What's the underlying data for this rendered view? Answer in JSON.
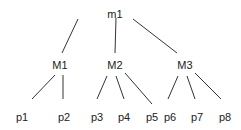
{
  "diagram": {
    "type": "tree",
    "root": {
      "id": "m1",
      "label": "m1",
      "x": 115,
      "y": 14
    },
    "level1": [
      {
        "id": "M1",
        "label": "M1",
        "x": 60,
        "y": 65
      },
      {
        "id": "M2",
        "label": "M2",
        "x": 115,
        "y": 65
      },
      {
        "id": "M3",
        "label": "M3",
        "x": 185,
        "y": 65
      }
    ],
    "leaves": [
      {
        "id": "p1",
        "label": "p1",
        "parent": "M1",
        "x": 22,
        "y": 117
      },
      {
        "id": "p2",
        "label": "p2",
        "parent": "M1",
        "x": 64,
        "y": 117
      },
      {
        "id": "p3",
        "label": "p3",
        "parent": "M2",
        "x": 97,
        "y": 117
      },
      {
        "id": "p4",
        "label": "p4",
        "parent": "M2",
        "x": 124,
        "y": 117
      },
      {
        "id": "p5",
        "label": "p5",
        "parent": "M2",
        "x": 152,
        "y": 117
      },
      {
        "id": "p6",
        "label": "p6",
        "parent": "M3",
        "x": 170,
        "y": 117
      },
      {
        "id": "p7",
        "label": "p7",
        "parent": "M3",
        "x": 197,
        "y": 117
      },
      {
        "id": "p8",
        "label": "p8",
        "parent": "M3",
        "x": 225,
        "y": 117
      }
    ],
    "edges": [
      {
        "from": "m1",
        "to": "M1",
        "x1": 78,
        "y1": 19,
        "x2": 62,
        "y2": 53
      },
      {
        "from": "m1",
        "to": "M2",
        "x1": 116,
        "y1": 18,
        "x2": 115,
        "y2": 53
      },
      {
        "from": "m1",
        "to": "M3",
        "x1": 133,
        "y1": 19,
        "x2": 177,
        "y2": 53
      },
      {
        "from": "M1",
        "to": "p1",
        "x1": 55,
        "y1": 75,
        "x2": 32,
        "y2": 99
      },
      {
        "from": "M1",
        "to": "p2",
        "x1": 63,
        "y1": 75,
        "x2": 63,
        "y2": 99
      },
      {
        "from": "M2",
        "to": "p3",
        "x1": 107,
        "y1": 76,
        "x2": 97,
        "y2": 99
      },
      {
        "from": "M2",
        "to": "p4",
        "x1": 116,
        "y1": 76,
        "x2": 124,
        "y2": 99
      },
      {
        "from": "M2",
        "to": "p5",
        "x1": 125,
        "y1": 73,
        "x2": 152,
        "y2": 104
      },
      {
        "from": "M3",
        "to": "p6",
        "x1": 178,
        "y1": 76,
        "x2": 168,
        "y2": 99
      },
      {
        "from": "M3",
        "to": "p7",
        "x1": 187,
        "y1": 76,
        "x2": 195,
        "y2": 99
      },
      {
        "from": "M3",
        "to": "p8",
        "x1": 195,
        "y1": 73,
        "x2": 221,
        "y2": 99
      }
    ]
  }
}
